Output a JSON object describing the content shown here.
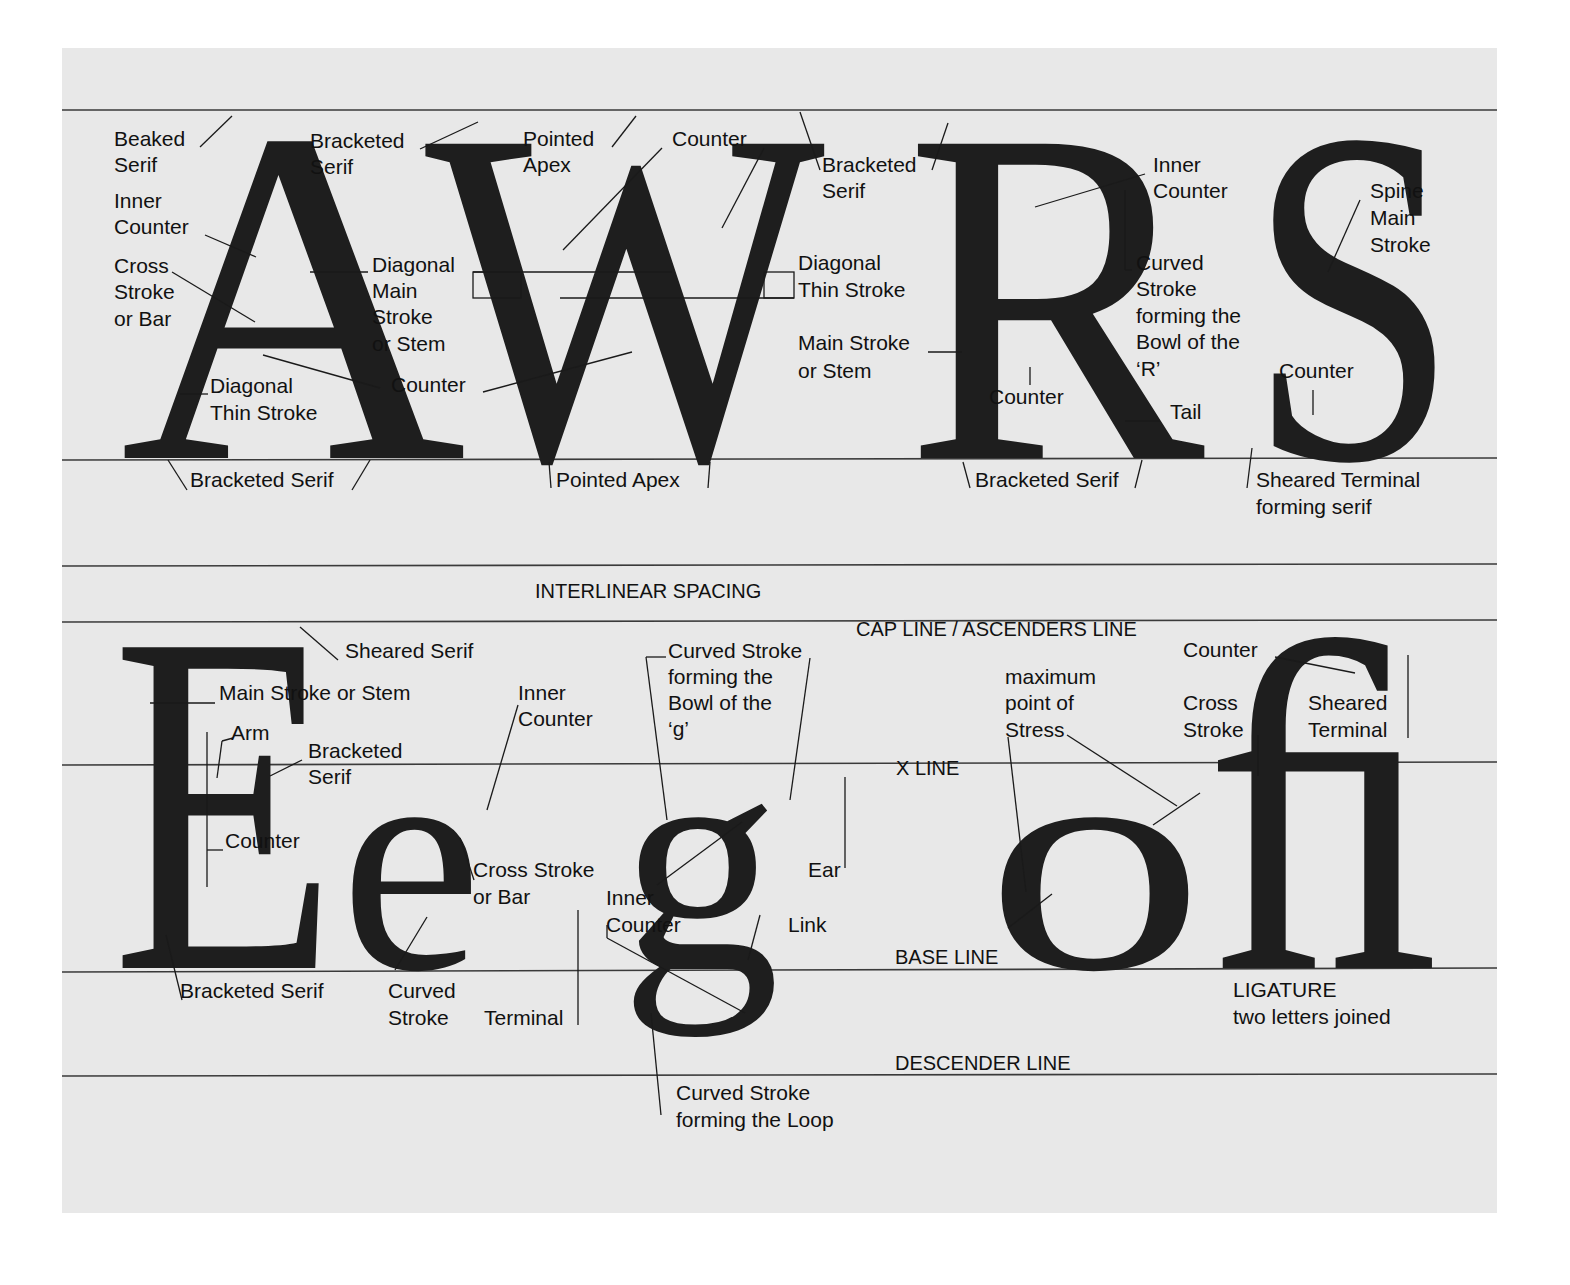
{
  "colors": {
    "panel": "#e8e8e8",
    "ink": "#1e1e1e",
    "rule": "#3a3a3a",
    "page": "#ffffff"
  },
  "upper_row": {
    "letters": [
      "A",
      "W",
      "R",
      "S"
    ],
    "A": {
      "beaked_serif": [
        "Beaked",
        "Serif"
      ],
      "bracketed_serif_top": [
        "Bracketed",
        "Serif"
      ],
      "inner_counter": [
        "Inner",
        "Counter"
      ],
      "cross_stroke": [
        "Cross",
        "Stroke",
        "or Bar"
      ],
      "diagonal_main": [
        "Diagonal",
        "Main",
        "Stroke",
        "or Stem"
      ],
      "diagonal_thin": [
        "Diagonal",
        "Thin Stroke"
      ],
      "counter": "Counter",
      "bracketed_serif_bottom": "Bracketed Serif"
    },
    "W": {
      "pointed_apex_top": [
        "Pointed",
        "Apex"
      ],
      "counter": "Counter",
      "bracketed_serif": [
        "Bracketed",
        "Serif"
      ],
      "diagonal_thin": [
        "Diagonal",
        "Thin Stroke"
      ],
      "pointed_apex_bottom": "Pointed Apex"
    },
    "R": {
      "main_stroke": [
        "Main Stroke",
        "or Stem"
      ],
      "inner_counter": [
        "Inner",
        "Counter"
      ],
      "curved_stroke": [
        "Curved",
        "Stroke",
        "forming the",
        "Bowl of the",
        "‘R’"
      ],
      "counter": "Counter",
      "tail": "Tail",
      "bracketed_serif": "Bracketed Serif"
    },
    "S": {
      "spine": [
        "Spine",
        "Main",
        "Stroke"
      ],
      "counter": "Counter",
      "sheared_terminal": [
        "Sheared Terminal",
        "forming serif"
      ]
    }
  },
  "interlinear": "INTERLINEAR SPACING",
  "guide_lines": {
    "cap_line": "CAP LINE / ASCENDERS LINE",
    "x_line": "X LINE",
    "base_line": "BASE LINE",
    "descender_line": "DESCENDER LINE"
  },
  "lower_row": {
    "letters": [
      "E",
      "e",
      "g",
      "o",
      "ﬁ"
    ],
    "E": {
      "sheared_serif": "Sheared Serif",
      "main_stroke": "Main Stroke or Stem",
      "arm": "Arm",
      "bracketed_serif_mid": [
        "Bracketed",
        "Serif"
      ],
      "counter": "Counter",
      "bracketed_serif_bottom": "Bracketed Serif"
    },
    "e": {
      "inner_counter": [
        "Inner",
        "Counter"
      ],
      "cross_stroke": [
        "Cross Stroke",
        "or Bar"
      ],
      "curved_stroke": [
        "Curved",
        "Stroke"
      ],
      "terminal": "Terminal"
    },
    "g": {
      "bowl": [
        "Curved Stroke",
        "forming the",
        "Bowl of the",
        "‘g’"
      ],
      "ear": "Ear",
      "inner_counter": [
        "Inner",
        "Counter"
      ],
      "link": "Link",
      "loop": [
        "Curved Stroke",
        "forming the Loop"
      ]
    },
    "o": {
      "stress": [
        "maximum",
        "point of",
        "Stress"
      ]
    },
    "fi": {
      "counter": "Counter",
      "cross_stroke": [
        "Cross",
        "Stroke"
      ],
      "sheared_terminal": [
        "Sheared",
        "Terminal"
      ],
      "ligature": [
        "LIGATURE",
        "two letters joined"
      ]
    }
  }
}
